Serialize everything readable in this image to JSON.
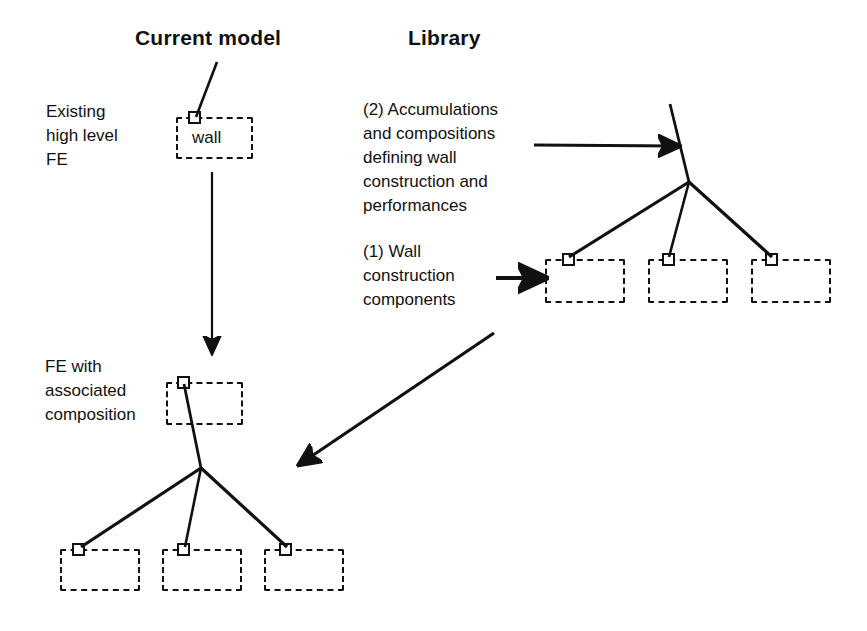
{
  "diagram": {
    "title_current_model": "Current model",
    "title_library": "Library",
    "labels": {
      "existing_fe": "Existing\nhigh level\nFE",
      "fe_with_composition": "FE with\nassociated\ncomposition",
      "library_note_2": "(2) Accumulations\nand compositions\ndefining wall\nconstruction and\nperformances",
      "library_note_1": "(1) Wall\nconstruction\ncomponents"
    },
    "boxes": {
      "wall": "wall"
    },
    "colors": {
      "ink": "#111111",
      "background": "#ffffff"
    },
    "icon_names": {
      "node": "node-square-icon",
      "arrow_down": "arrow-down-icon",
      "arrow_right": "arrow-right-icon",
      "arrow_diagonal": "arrow-diagonal-down-left-icon"
    }
  }
}
